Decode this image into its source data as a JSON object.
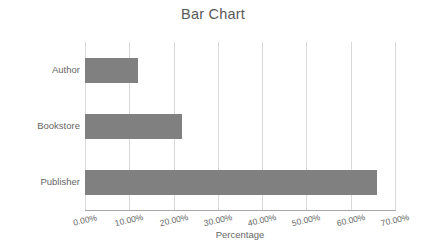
{
  "chart_data": {
    "type": "bar",
    "orientation": "horizontal",
    "title": "Bar Chart",
    "xlabel": "Percentage",
    "ylabel": "Revenue Category",
    "categories": [
      "Author",
      "Bookstore",
      "Publisher"
    ],
    "values": [
      12.0,
      22.0,
      66.0
    ],
    "value_labels": [
      "12.00%",
      "22.00%",
      "66.00%"
    ],
    "xlim": [
      0,
      70
    ],
    "xtick_values": [
      0,
      10,
      20,
      30,
      40,
      50,
      60,
      70
    ],
    "xtick_labels": [
      "0.00%",
      "10.00%",
      "20.00%",
      "30.00%",
      "40.00%",
      "50.00%",
      "60.00%",
      "70.00%"
    ],
    "grid": true,
    "grid_axis": "x",
    "legend": false,
    "bar_color": "#808080",
    "gridline_color": "#d9d9d9",
    "axis_color": "#a6a6a6",
    "text_color": "#666666",
    "title_color": "#5a5a5a",
    "background_color": "#ffffff"
  }
}
